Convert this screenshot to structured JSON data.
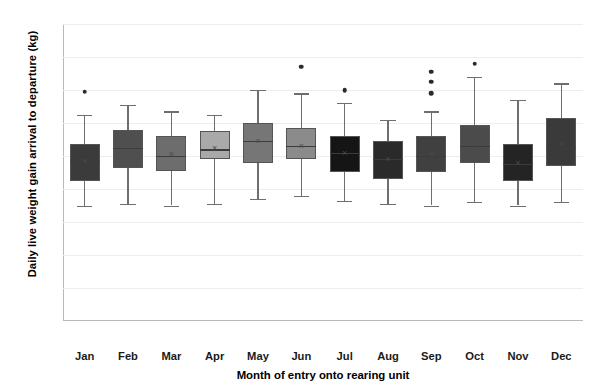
{
  "chart_data": {
    "type": "boxplot",
    "title": "",
    "xlabel": "Month of entry onto rearing unit",
    "ylabel": "Daily live weight gain arrival to departure (kg)",
    "ylim": [
      0,
      1.8
    ],
    "ytick_labels": [
      "0",
      "0.2",
      "0.4",
      "0.6",
      "0.8",
      "1",
      "1.2",
      "1.4",
      "1.6",
      "1.8"
    ],
    "ytick_values": [
      0,
      0.2,
      0.4,
      0.6,
      0.8,
      1.0,
      1.2,
      1.4,
      1.6,
      1.8
    ],
    "grid": "horizontal",
    "legend": "none",
    "categories": [
      "Jan",
      "Feb",
      "Mar",
      "Apr",
      "May",
      "Jun",
      "Jul",
      "Aug",
      "Sep",
      "Oct",
      "Nov",
      "Dec"
    ],
    "boxes": [
      {
        "category": "Jan",
        "min": 0.7,
        "q1": 0.85,
        "median": 0.97,
        "mean": 0.97,
        "q3": 1.07,
        "max": 1.25,
        "outliers": [
          1.39
        ],
        "color": "#3b3b3b"
      },
      {
        "category": "Feb",
        "min": 0.71,
        "q1": 0.93,
        "median": 1.05,
        "mean": 1.04,
        "q3": 1.16,
        "max": 1.31,
        "outliers": [],
        "color": "#4f4f4f"
      },
      {
        "category": "Mar",
        "min": 0.7,
        "q1": 0.91,
        "median": 1.0,
        "mean": 1.01,
        "q3": 1.12,
        "max": 1.27,
        "outliers": [],
        "color": "#6d6d6d"
      },
      {
        "category": "Apr",
        "min": 0.71,
        "q1": 0.98,
        "median": 1.04,
        "mean": 1.05,
        "q3": 1.15,
        "max": 1.25,
        "outliers": [],
        "color": "#a9a9a9"
      },
      {
        "category": "May",
        "min": 0.74,
        "q1": 0.96,
        "median": 1.09,
        "mean": 1.09,
        "q3": 1.2,
        "max": 1.4,
        "outliers": [],
        "color": "#767676"
      },
      {
        "category": "Jun",
        "min": 0.76,
        "q1": 0.98,
        "median": 1.06,
        "mean": 1.06,
        "q3": 1.17,
        "max": 1.38,
        "outliers": [
          1.54
        ],
        "color": "#8b8b8b"
      },
      {
        "category": "Jul",
        "min": 0.73,
        "q1": 0.9,
        "median": 1.02,
        "mean": 1.02,
        "q3": 1.12,
        "max": 1.32,
        "outliers": [
          1.4
        ],
        "color": "#151515"
      },
      {
        "category": "Aug",
        "min": 0.71,
        "q1": 0.86,
        "median": 0.98,
        "mean": 0.98,
        "q3": 1.09,
        "max": 1.22,
        "outliers": [],
        "color": "#2a2a2a"
      },
      {
        "category": "Sep",
        "min": 0.7,
        "q1": 0.9,
        "median": 1.0,
        "mean": 1.01,
        "q3": 1.12,
        "max": 1.27,
        "outliers": [
          1.38,
          1.45,
          1.51
        ],
        "color": "#404040"
      },
      {
        "category": "Oct",
        "min": 0.72,
        "q1": 0.96,
        "median": 1.06,
        "mean": 1.07,
        "q3": 1.19,
        "max": 1.48,
        "outliers": [
          1.56
        ],
        "color": "#4b4b4b"
      },
      {
        "category": "Nov",
        "min": 0.7,
        "q1": 0.85,
        "median": 0.95,
        "mean": 0.96,
        "q3": 1.07,
        "max": 1.34,
        "outliers": [],
        "color": "#242424"
      },
      {
        "category": "Dec",
        "min": 0.72,
        "q1": 0.94,
        "median": 1.05,
        "mean": 1.07,
        "q3": 1.23,
        "max": 1.44,
        "outliers": [],
        "color": "#3a3a3a"
      }
    ]
  },
  "caption": {
    "text": ""
  }
}
